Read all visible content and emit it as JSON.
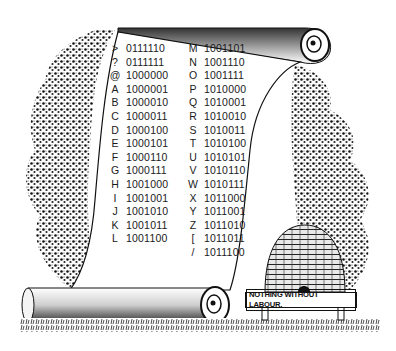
{
  "illustration": {
    "title": "Binary code scroll engraving",
    "motto": "NOTHING WITHOUT LABOUR.",
    "elements": [
      "scroll",
      "trees",
      "beehive",
      "grass",
      "sign"
    ]
  },
  "code_table": {
    "left_column": [
      {
        "symbol": ">",
        "code": "0111110"
      },
      {
        "symbol": "?",
        "code": "0111111"
      },
      {
        "symbol": "@",
        "code": "1000000"
      },
      {
        "symbol": "A",
        "code": "1000001"
      },
      {
        "symbol": "B",
        "code": "1000010"
      },
      {
        "symbol": "C",
        "code": "1000011"
      },
      {
        "symbol": "D",
        "code": "1000100"
      },
      {
        "symbol": "E",
        "code": "1000101"
      },
      {
        "symbol": "F",
        "code": "1000110"
      },
      {
        "symbol": "G",
        "code": "1000111"
      },
      {
        "symbol": "H",
        "code": "1001000"
      },
      {
        "symbol": "I",
        "code": "1001001"
      },
      {
        "symbol": "J",
        "code": "1001010"
      },
      {
        "symbol": "K",
        "code": "1001011"
      },
      {
        "symbol": "L",
        "code": "1001100"
      }
    ],
    "right_column": [
      {
        "symbol": "M",
        "code": "1001101"
      },
      {
        "symbol": "N",
        "code": "1001110"
      },
      {
        "symbol": "O",
        "code": "1001111"
      },
      {
        "symbol": "P",
        "code": "1010000"
      },
      {
        "symbol": "Q",
        "code": "1010001"
      },
      {
        "symbol": "R",
        "code": "1010010"
      },
      {
        "symbol": "S",
        "code": "1010011"
      },
      {
        "symbol": "T",
        "code": "1010100"
      },
      {
        "symbol": "U",
        "code": "1010101"
      },
      {
        "symbol": "V",
        "code": "1010110"
      },
      {
        "symbol": "W",
        "code": "1010111"
      },
      {
        "symbol": "X",
        "code": "1011000"
      },
      {
        "symbol": "Y",
        "code": "1011001"
      },
      {
        "symbol": "Z",
        "code": "1011010"
      },
      {
        "symbol": "[",
        "code": "1011011"
      },
      {
        "symbol": "/",
        "code": "1011100"
      }
    ]
  },
  "colors": {
    "ink": "#111111",
    "paper": "#ffffff"
  }
}
